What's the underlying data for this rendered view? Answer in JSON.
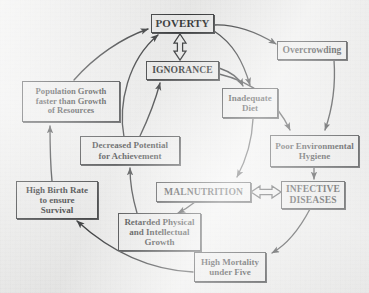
{
  "diagram": {
    "background_color": "#ececeb",
    "ink_color": "#0e1011",
    "nodes": [
      {
        "id": "poverty",
        "label": "POVERTY",
        "lines": [
          "POVERTY"
        ]
      },
      {
        "id": "ignorance",
        "label": "IGNORANCE",
        "lines": [
          "IGNORANCE"
        ]
      },
      {
        "id": "overcrowding",
        "label": "Overcrowding",
        "lines": [
          "Overcrowding"
        ]
      },
      {
        "id": "inadequate-diet",
        "label": "Inadequate Diet",
        "lines": [
          "Inadequate",
          "Diet"
        ]
      },
      {
        "id": "poor-environmental-hygiene",
        "label": "Poor Environmental Hygiene",
        "lines": [
          "Poor Environmental",
          "Hygiene"
        ]
      },
      {
        "id": "infective-diseases",
        "label": "INFECTIVE DISEASES",
        "lines": [
          "INFECTIVE",
          "DISEASES"
        ]
      },
      {
        "id": "malnutrition",
        "label": "MALNUTRITION",
        "lines": [
          "MALNUTRITION"
        ]
      },
      {
        "id": "high-mortality-under-five",
        "label": "High Mortality under Five",
        "lines": [
          "High Mortality",
          "under Five"
        ]
      },
      {
        "id": "retarded-growth",
        "label": "Retarded Physical and Intellectual Growth",
        "lines": [
          "Retarded Physical",
          "and Intellectual",
          "Growth"
        ]
      },
      {
        "id": "decreased-potential",
        "label": "Decreased Potential for Achievement",
        "lines": [
          "Decreased Potential",
          "for Achievement"
        ]
      },
      {
        "id": "high-birth-rate",
        "label": "High Birth Rate to ensure Survival",
        "lines": [
          "High Birth Rate",
          "to ensure",
          "Survival"
        ]
      },
      {
        "id": "population-growth",
        "label": "Population Growth faster than Growth of Resources",
        "lines": [
          "Population Growth",
          "faster than Growth",
          "of Resources"
        ]
      }
    ],
    "connectors": [
      {
        "from": "poverty",
        "to": "overcrowding",
        "style": "curved-line-arrow"
      },
      {
        "from": "poverty",
        "to": "inadequate-diet",
        "style": "curved-line-arrow"
      },
      {
        "from": "poverty",
        "to": "ignorance",
        "style": "hollow-double-arrow-vertical"
      },
      {
        "from": "ignorance",
        "to": "inadequate-diet",
        "style": "curved-line-arrow"
      },
      {
        "from": "ignorance",
        "to": "poor-environmental-hygiene",
        "style": "curved-line-arrow"
      },
      {
        "from": "overcrowding",
        "to": "poor-environmental-hygiene",
        "style": "curved-line-arrow"
      },
      {
        "from": "poor-environmental-hygiene",
        "to": "infective-diseases",
        "style": "line-arrow"
      },
      {
        "from": "inadequate-diet",
        "to": "malnutrition",
        "style": "curved-line-arrow"
      },
      {
        "from": "malnutrition",
        "to": "infective-diseases",
        "style": "hollow-double-arrow-horizontal"
      },
      {
        "from": "infective-diseases",
        "to": "high-mortality-under-five",
        "style": "curved-line-arrow"
      },
      {
        "from": "malnutrition",
        "to": "retarded-growth",
        "style": "curved-line-arrow"
      },
      {
        "from": "high-mortality-under-five",
        "to": "high-birth-rate",
        "style": "curved-line-arrow"
      },
      {
        "from": "retarded-growth",
        "to": "decreased-potential",
        "style": "curved-line-arrow"
      },
      {
        "from": "decreased-potential",
        "to": "poverty",
        "style": "curved-line-arrow"
      },
      {
        "from": "decreased-potential",
        "to": "ignorance",
        "style": "curved-line-arrow"
      },
      {
        "from": "high-birth-rate",
        "to": "population-growth",
        "style": "curved-line-arrow"
      },
      {
        "from": "population-growth",
        "to": "poverty",
        "style": "curved-line-arrow"
      }
    ]
  }
}
